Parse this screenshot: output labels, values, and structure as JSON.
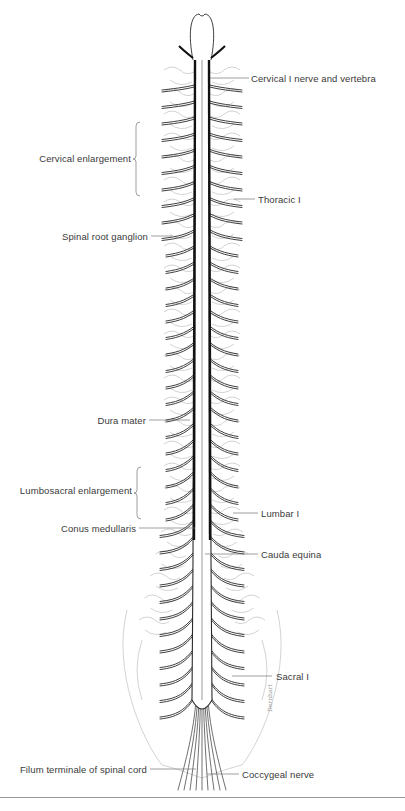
{
  "figure": {
    "colors": {
      "ink": "#2a2a2a",
      "label": "#3a3a3a",
      "faint": "#c8c8c8",
      "rule": "#9a9a9a"
    }
  },
  "labels": {
    "right": [
      {
        "text": "Cervical I nerve and vertebra",
        "x": 251,
        "y": 73,
        "lead_x1": 210,
        "lead_x2": 249,
        "lead_y": 78
      },
      {
        "text": "Thoracic I",
        "x": 258,
        "y": 194,
        "lead_x1": 234,
        "lead_x2": 255,
        "lead_y": 199
      },
      {
        "text": "Lumbar I",
        "x": 261,
        "y": 508,
        "lead_x1": 233,
        "lead_x2": 258,
        "lead_y": 513
      },
      {
        "text": "Cauda equina",
        "x": 261,
        "y": 549,
        "lead_x1": 205,
        "lead_x2": 258,
        "lead_y": 554
      },
      {
        "text": "Sacral I",
        "x": 276,
        "y": 671,
        "lead_x1": 232,
        "lead_x2": 272,
        "lead_y": 676
      },
      {
        "text": "Coccygeal nerve",
        "x": 242,
        "y": 769,
        "lead_x1": 207,
        "lead_x2": 239,
        "lead_y": 774
      }
    ],
    "left": [
      {
        "text": "Cervical enlargement",
        "right": 131,
        "y": 153,
        "brace_top": 122,
        "brace_bottom": 196
      },
      {
        "text": "Spinal root ganglion",
        "right": 148,
        "y": 231,
        "lead_x1": 151,
        "lead_x2": 172,
        "lead_y": 236
      },
      {
        "text": "Dura mater",
        "right": 146,
        "y": 415,
        "lead_x1": 149,
        "lead_x2": 190,
        "lead_y": 420
      },
      {
        "text": "Lumbosacral enlargement",
        "right": 132,
        "y": 485,
        "brace_top": 467,
        "brace_bottom": 519
      },
      {
        "text": "Conus medullaris",
        "right": 136,
        "y": 523,
        "lead_x1": 139,
        "lead_x2": 195,
        "lead_y": 528
      },
      {
        "text": "Filum terminale of spinal cord",
        "right": 147,
        "y": 764,
        "lead_x1": 150,
        "lead_x2": 196,
        "lead_y": 769
      }
    ]
  },
  "signature": "Dernhart"
}
